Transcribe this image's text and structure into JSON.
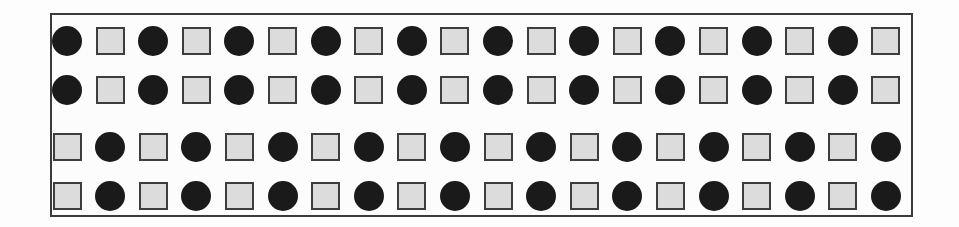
{
  "diagram": {
    "title": "",
    "grid": {
      "rows": 4,
      "columns": 20,
      "pattern": [
        [
          "circle",
          "square",
          "circle",
          "square",
          "circle",
          "square",
          "circle",
          "square",
          "circle",
          "square",
          "circle",
          "square",
          "circle",
          "square",
          "circle",
          "square",
          "circle",
          "square",
          "circle",
          "square"
        ],
        [
          "circle",
          "square",
          "circle",
          "square",
          "circle",
          "square",
          "circle",
          "square",
          "circle",
          "square",
          "circle",
          "square",
          "circle",
          "square",
          "circle",
          "square",
          "circle",
          "square",
          "circle",
          "square"
        ],
        [
          "square",
          "circle",
          "square",
          "circle",
          "square",
          "circle",
          "square",
          "circle",
          "square",
          "circle",
          "square",
          "circle",
          "square",
          "circle",
          "square",
          "circle",
          "square",
          "circle",
          "square",
          "circle"
        ],
        [
          "square",
          "circle",
          "square",
          "circle",
          "square",
          "circle",
          "square",
          "circle",
          "square",
          "circle",
          "square",
          "circle",
          "square",
          "circle",
          "square",
          "circle",
          "square",
          "circle",
          "square",
          "circle"
        ]
      ]
    },
    "colors": {
      "circle_fill": "#1a1a1a",
      "square_fill": "#dcdcdc",
      "square_border": "#3d3d3d",
      "frame_border": "#3a3a3a"
    }
  }
}
